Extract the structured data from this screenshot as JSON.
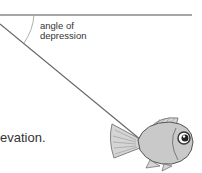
{
  "diagram": {
    "angle_label_line1": "angle of",
    "angle_label_line2": "depression",
    "caption_fragment": "evation.",
    "colors": {
      "line": "#777777",
      "fish_body": "#c8c8c8",
      "fish_outline": "#555555"
    },
    "icons": {
      "fish": "fish-illustration"
    }
  }
}
